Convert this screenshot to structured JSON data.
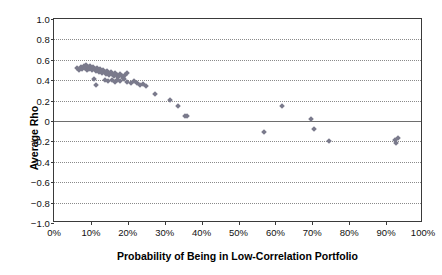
{
  "chart_data": {
    "type": "scatter",
    "title": "",
    "xlabel": "Probability of Being in Low-Correlation Portfolio",
    "ylabel": "Average Rho",
    "xlim": [
      0,
      100
    ],
    "ylim": [
      -1.0,
      1.0
    ],
    "grid": true,
    "legend": false,
    "marker_color": "#7a7a8c",
    "marker_shape": "diamond",
    "xticklabels": [
      "0%",
      "10%",
      "20%",
      "30%",
      "40%",
      "50%",
      "60%",
      "70%",
      "80%",
      "90%",
      "100%"
    ],
    "xtickvalues": [
      0,
      10,
      20,
      30,
      40,
      50,
      60,
      70,
      80,
      90,
      100
    ],
    "yticklabels": [
      "1.0",
      "0.8",
      "0.6",
      "0.4",
      "0.2",
      "0",
      "−0.2",
      "−0.4",
      "−0.6",
      "−0.8",
      "−1.0"
    ],
    "ytickvalues": [
      1.0,
      0.8,
      0.6,
      0.4,
      0.2,
      0,
      -0.2,
      -0.4,
      -0.6,
      -0.8,
      -1.0
    ],
    "points": [
      {
        "x": 6.3,
        "y": 0.52
      },
      {
        "x": 6.8,
        "y": 0.5
      },
      {
        "x": 7.2,
        "y": 0.53
      },
      {
        "x": 7.6,
        "y": 0.51
      },
      {
        "x": 8.0,
        "y": 0.54
      },
      {
        "x": 8.3,
        "y": 0.52
      },
      {
        "x": 8.6,
        "y": 0.55
      },
      {
        "x": 8.9,
        "y": 0.5
      },
      {
        "x": 9.2,
        "y": 0.53
      },
      {
        "x": 9.5,
        "y": 0.51
      },
      {
        "x": 9.8,
        "y": 0.54
      },
      {
        "x": 10.1,
        "y": 0.52
      },
      {
        "x": 10.4,
        "y": 0.5
      },
      {
        "x": 10.7,
        "y": 0.53
      },
      {
        "x": 11.0,
        "y": 0.51
      },
      {
        "x": 11.3,
        "y": 0.49
      },
      {
        "x": 11.6,
        "y": 0.52
      },
      {
        "x": 11.9,
        "y": 0.5
      },
      {
        "x": 12.2,
        "y": 0.48
      },
      {
        "x": 12.5,
        "y": 0.51
      },
      {
        "x": 12.8,
        "y": 0.49
      },
      {
        "x": 13.1,
        "y": 0.47
      },
      {
        "x": 13.4,
        "y": 0.5
      },
      {
        "x": 13.7,
        "y": 0.48
      },
      {
        "x": 14.0,
        "y": 0.46
      },
      {
        "x": 14.3,
        "y": 0.49
      },
      {
        "x": 14.7,
        "y": 0.47
      },
      {
        "x": 15.0,
        "y": 0.45
      },
      {
        "x": 15.4,
        "y": 0.48
      },
      {
        "x": 15.8,
        "y": 0.46
      },
      {
        "x": 16.2,
        "y": 0.44
      },
      {
        "x": 16.6,
        "y": 0.47
      },
      {
        "x": 17.0,
        "y": 0.45
      },
      {
        "x": 17.4,
        "y": 0.43
      },
      {
        "x": 17.9,
        "y": 0.46
      },
      {
        "x": 18.3,
        "y": 0.44
      },
      {
        "x": 18.8,
        "y": 0.42
      },
      {
        "x": 19.3,
        "y": 0.45
      },
      {
        "x": 19.8,
        "y": 0.47
      },
      {
        "x": 10.9,
        "y": 0.41
      },
      {
        "x": 11.4,
        "y": 0.35
      },
      {
        "x": 13.9,
        "y": 0.4
      },
      {
        "x": 14.6,
        "y": 0.39
      },
      {
        "x": 15.6,
        "y": 0.4
      },
      {
        "x": 16.4,
        "y": 0.38
      },
      {
        "x": 17.2,
        "y": 0.4
      },
      {
        "x": 18.0,
        "y": 0.39
      },
      {
        "x": 18.9,
        "y": 0.41
      },
      {
        "x": 19.9,
        "y": 0.38
      },
      {
        "x": 20.8,
        "y": 0.37
      },
      {
        "x": 21.6,
        "y": 0.39
      },
      {
        "x": 22.4,
        "y": 0.37
      },
      {
        "x": 23.2,
        "y": 0.35
      },
      {
        "x": 24.1,
        "y": 0.36
      },
      {
        "x": 25.0,
        "y": 0.34
      },
      {
        "x": 27.4,
        "y": 0.26
      },
      {
        "x": 31.5,
        "y": 0.21
      },
      {
        "x": 33.6,
        "y": 0.15
      },
      {
        "x": 35.4,
        "y": 0.05
      },
      {
        "x": 36.0,
        "y": 0.05
      },
      {
        "x": 56.9,
        "y": -0.11
      },
      {
        "x": 61.8,
        "y": 0.15
      },
      {
        "x": 69.6,
        "y": 0.02
      },
      {
        "x": 70.4,
        "y": -0.08
      },
      {
        "x": 74.6,
        "y": -0.2
      },
      {
        "x": 92.4,
        "y": -0.19
      },
      {
        "x": 92.8,
        "y": -0.22
      },
      {
        "x": 93.2,
        "y": -0.17
      }
    ]
  }
}
